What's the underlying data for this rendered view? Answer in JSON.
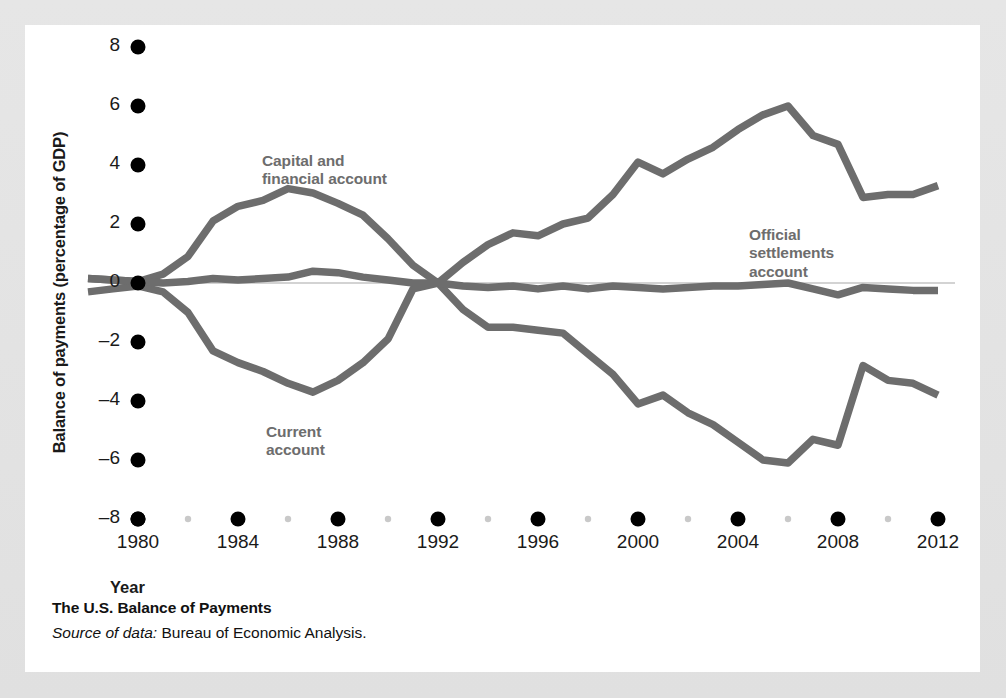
{
  "figure": {
    "caption_title": "The U.S. Balance of Payments",
    "source_prefix": "Source of data:",
    "source_text": " Bureau of Economic Analysis."
  },
  "colors": {
    "page_background": "#e3e3e3",
    "card_background": "#ffffff",
    "line": "#6d6d6d",
    "tick_major": "#000000",
    "tick_minor": "#c9c9c9",
    "zero_line": "#bdbdbd",
    "text": "#1a1a1a",
    "series_label": "#6d6d6d"
  },
  "chart_data": {
    "type": "line",
    "title": "The U.S. Balance of Payments",
    "xlabel": "Year",
    "ylabel": "Balance of payments (percentage of GDP)",
    "xlim": [
      1978,
      2012.5
    ],
    "ylim": [
      -8,
      8
    ],
    "xticks": [
      1980,
      1984,
      1988,
      1992,
      1996,
      2000,
      2004,
      2008,
      2012
    ],
    "xticks_minor": [
      1982,
      1986,
      1990,
      1994,
      1998,
      2002,
      2006,
      2010
    ],
    "yticks": [
      8,
      6,
      4,
      2,
      0,
      -2,
      -4,
      -6,
      -8
    ],
    "ytick_labels": [
      "8",
      "6",
      "4",
      "2",
      "0",
      "-2",
      "-4",
      "-6",
      "-8"
    ],
    "grid": false,
    "legend": "inline-annotations",
    "x": [
      1978,
      1979,
      1980,
      1981,
      1982,
      1983,
      1984,
      1985,
      1986,
      1987,
      1988,
      1989,
      1990,
      1991,
      1992,
      1993,
      1994,
      1995,
      1996,
      1997,
      1998,
      1999,
      2000,
      2001,
      2002,
      2003,
      2004,
      2005,
      2006,
      2007,
      2008,
      2009,
      2010,
      2011,
      2012
    ],
    "series": [
      {
        "name": "Capital and financial account",
        "label_text": "Capital and\nfinancial account",
        "values": [
          0.15,
          0.1,
          0.05,
          0.3,
          0.9,
          2.1,
          2.6,
          2.8,
          3.2,
          3.05,
          2.7,
          2.3,
          1.5,
          0.6,
          0.0,
          0.7,
          1.3,
          1.7,
          1.6,
          2.0,
          2.2,
          3.0,
          4.1,
          3.7,
          4.2,
          4.6,
          5.2,
          5.7,
          6.0,
          5.0,
          4.7,
          2.9,
          3.0,
          3.0,
          3.3
        ]
      },
      {
        "name": "Current account",
        "label_text": "Current\naccount",
        "values": [
          -0.3,
          -0.2,
          -0.1,
          -0.3,
          -1.0,
          -2.3,
          -2.7,
          -3.0,
          -3.4,
          -3.7,
          -3.3,
          -2.7,
          -1.9,
          -0.2,
          0.0,
          -0.9,
          -1.5,
          -1.5,
          -1.6,
          -1.7,
          -2.4,
          -3.1,
          -4.1,
          -3.8,
          -4.4,
          -4.8,
          -5.4,
          -6.0,
          -6.1,
          -5.3,
          -5.5,
          -2.8,
          -3.3,
          -3.4,
          -3.8
        ]
      },
      {
        "name": "Official settlements account",
        "label_text": "Official\nsettlements\naccount",
        "values": [
          0.15,
          0.1,
          0.05,
          0.0,
          0.05,
          0.15,
          0.1,
          0.15,
          0.2,
          0.4,
          0.35,
          0.2,
          0.1,
          0.0,
          0.0,
          -0.1,
          -0.15,
          -0.1,
          -0.2,
          -0.1,
          -0.2,
          -0.1,
          -0.15,
          -0.2,
          -0.15,
          -0.1,
          -0.1,
          -0.05,
          0.0,
          -0.2,
          -0.4,
          -0.15,
          -0.2,
          -0.25,
          -0.25
        ]
      }
    ]
  }
}
